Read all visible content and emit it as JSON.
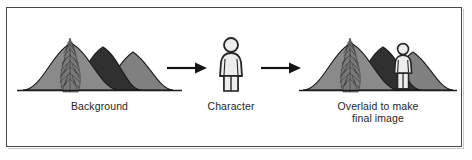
{
  "diagram": {
    "title_visible": false,
    "background_color": "#ffffff",
    "frame_color": "#4a4a4a",
    "panels": [
      {
        "id": "background-panel",
        "caption": "Background",
        "elements": [
          "hill-left",
          "hill-middle-dark",
          "hill-right",
          "bush-tree",
          "ground-line"
        ]
      },
      {
        "id": "character-panel",
        "caption": "Character",
        "elements": [
          "stick-figure"
        ]
      },
      {
        "id": "composite-panel",
        "caption": "Overlaid to make\nfinal image",
        "elements": [
          "hill-left",
          "hill-middle-dark",
          "hill-right",
          "bush-tree",
          "ground-line",
          "stick-figure"
        ]
      }
    ],
    "connectors": [
      {
        "id": "arrow-1",
        "direction": "right",
        "from": "background-panel",
        "to": "character-panel"
      },
      {
        "id": "arrow-2",
        "direction": "right",
        "from": "character-panel",
        "to": "composite-panel"
      }
    ],
    "colors": {
      "hill_light_gray": "#8c8c8c",
      "hill_mid_gray": "#7a7a7a",
      "hill_dark": "#3a3a3a",
      "outline": "#1a1a1a",
      "figure_fill": "#e8e8e8",
      "figure_outline": "#2a2a2a",
      "bush": "#6f6f6f",
      "ground": "#1a1a1a",
      "text": "#262626"
    }
  }
}
